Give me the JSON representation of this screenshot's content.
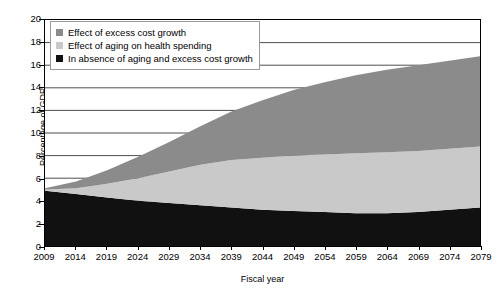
{
  "chart_data": {
    "type": "area",
    "stacked": true,
    "title": "",
    "xlabel": "Fiscal year",
    "ylabel": "Percentage of GDP",
    "xlim": [
      2009,
      2079
    ],
    "ylim": [
      0,
      20
    ],
    "ytick_step": 2,
    "xtick_step": 5,
    "grid": "horizontal",
    "legend_position": "top-left",
    "x": [
      2009,
      2014,
      2019,
      2024,
      2029,
      2034,
      2039,
      2044,
      2049,
      2054,
      2059,
      2064,
      2069,
      2074,
      2079
    ],
    "xtick_labels": [
      "2009",
      "2014",
      "2019",
      "2024",
      "2029",
      "2034",
      "2039",
      "2044",
      "2049",
      "2054",
      "2059",
      "2064",
      "2069",
      "2074",
      "2079"
    ],
    "ytick_labels": [
      "0",
      "2",
      "4",
      "6",
      "8",
      "10",
      "12",
      "14",
      "16",
      "18",
      "20"
    ],
    "series": [
      {
        "name": "In absence of aging and excess cost growth",
        "color": "#111111",
        "values": [
          4.9,
          4.6,
          4.3,
          4.0,
          3.8,
          3.6,
          3.4,
          3.2,
          3.1,
          3.0,
          2.9,
          2.9,
          3.0,
          3.2,
          3.4
        ]
      },
      {
        "name": "Effect of aging on health spending",
        "color": "#c9c9c9",
        "values": [
          0.1,
          0.5,
          1.2,
          2.0,
          2.8,
          3.6,
          4.2,
          4.6,
          4.9,
          5.1,
          5.3,
          5.4,
          5.4,
          5.4,
          5.4
        ]
      },
      {
        "name": "Effect of excess cost growth",
        "color": "#8b8b8b",
        "values": [
          0.1,
          0.6,
          1.2,
          1.9,
          2.6,
          3.4,
          4.3,
          5.1,
          5.8,
          6.4,
          6.9,
          7.3,
          7.6,
          7.8,
          8.0
        ]
      }
    ],
    "cumulative_top": [
      5.1,
      5.7,
      6.7,
      7.9,
      9.2,
      10.6,
      11.9,
      12.9,
      13.8,
      14.5,
      15.1,
      15.6,
      16.0,
      16.4,
      16.8
    ]
  },
  "legend": {
    "items": [
      {
        "label": "Effect of excess cost growth",
        "color": "#8b8b8b"
      },
      {
        "label": "Effect of aging on health spending",
        "color": "#c9c9c9"
      },
      {
        "label": "In absence of aging and excess cost growth",
        "color": "#111111"
      }
    ]
  },
  "axes": {
    "y_title": "Percentage of GDP",
    "x_title": "Fiscal year"
  }
}
